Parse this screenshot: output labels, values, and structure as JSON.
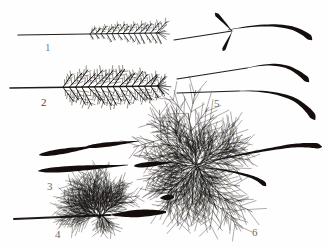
{
  "plate": {
    "kind": "scientific-line-illustration",
    "subject": "grass awns and plumose bristles",
    "background_color": "#fefefe",
    "ink_color": "#14110f",
    "label_color": "#5a5a58",
    "width": 328,
    "height": 247
  },
  "figures": [
    {
      "number": "1",
      "label_x": 45,
      "label_y": 41,
      "label_tone": "faint",
      "description": "slender straight awn with pinnate barbs along distal half",
      "axis": {
        "x1": 18,
        "y1": 35,
        "x2": 158,
        "y2": 33
      },
      "plume": {
        "start_x": 90,
        "end_x": 156,
        "rows": 13,
        "barb_length_up": 15,
        "barb_length_down": 13,
        "angle_up": -52,
        "angle_down": 58
      }
    },
    {
      "number": "2",
      "label_x": 41,
      "label_y": 96,
      "label_tone": "dark",
      "description": "densely plumose awn, barbs on both sides of the rachis, broader plume",
      "axis": {
        "x1": 10,
        "y1": 88,
        "x2": 158,
        "y2": 86
      },
      "plume": {
        "start_x": 63,
        "end_x": 157,
        "rows": 16,
        "barb_length_up": 20,
        "barb_length_down": 19,
        "angle_up": -50,
        "angle_down": 55
      }
    },
    {
      "number": "3",
      "label_x": 47,
      "label_y": 180,
      "label_tone": "mid",
      "description": "three solid lanceolate callus bodies, glabrous and tapering",
      "bodies": [
        {
          "x1": 39,
          "y1": 155,
          "x2": 97,
          "y2": 146,
          "thickness": 5.0
        },
        {
          "x1": 86,
          "y1": 147,
          "x2": 139,
          "y2": 141,
          "thickness": 4.2
        },
        {
          "x1": 38,
          "y1": 171,
          "x2": 128,
          "y2": 165,
          "thickness": 5.4
        },
        {
          "x1": 134,
          "y1": 166,
          "x2": 174,
          "y2": 162,
          "thickness": 4.6
        }
      ]
    },
    {
      "number": "4",
      "label_x": 55,
      "label_y": 228,
      "label_tone": "mid",
      "description": "stout awn with a lateral tuft of finely divided plumose branches at the junction",
      "axis": {
        "x1": 14,
        "y1": 219,
        "x2": 164,
        "y2": 214
      },
      "thick_segment": {
        "x1": 110,
        "y1": 215,
        "x2": 166,
        "y2": 212,
        "thickness": 7
      },
      "tuft": {
        "cx": 101,
        "cy": 217,
        "branches": 14,
        "spread": 150,
        "length": 30
      }
    },
    {
      "number": "5",
      "label_x": 214,
      "label_y": 97,
      "label_tone": "mid",
      "description": "two curved awns, each with a slender hyaline base and a thickened dark geniculate apex",
      "awns": [
        {
          "thin": {
            "x1": 177,
            "y1": 79,
            "x2": 247,
            "y2": 68
          },
          "thick_path": "M 247 68 Q 276 61 292 69 Q 303 75 309 82",
          "max_thickness": 6
        },
        {
          "thin": {
            "x1": 177,
            "y1": 93,
            "x2": 239,
            "y2": 91
          },
          "thick_path": "M 239 91 Q 278 90 297 101 Q 310 110 315 120",
          "max_thickness": 7
        }
      ]
    },
    {
      "number": "6",
      "label_x": 252,
      "label_y": 226,
      "label_tone": "mid",
      "description": "plumose bristle with a radiating crown of finely branched capillary rays plus two stout smooth awns",
      "crown": {
        "cx": 196,
        "cy": 166,
        "rays": 22,
        "length": 46
      },
      "stout_awns": [
        {
          "path": "M 198 164 Q 250 152 290 146 Q 312 144 322 147",
          "max_thickness": 6
        },
        {
          "path": "M 198 167 Q 232 170 252 177 Q 262 181 266 186",
          "max_thickness": 5
        }
      ],
      "stub": {
        "x1": 160,
        "y1": 198,
        "x2": 174,
        "y2": 197,
        "thickness": 5
      }
    }
  ]
}
